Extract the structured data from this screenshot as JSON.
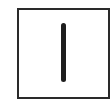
{
  "figure": {
    "glyph": "|",
    "frame_color": "#2a2a2a",
    "stroke_color": "#1e1e1e",
    "background_color": "#ffffff"
  }
}
